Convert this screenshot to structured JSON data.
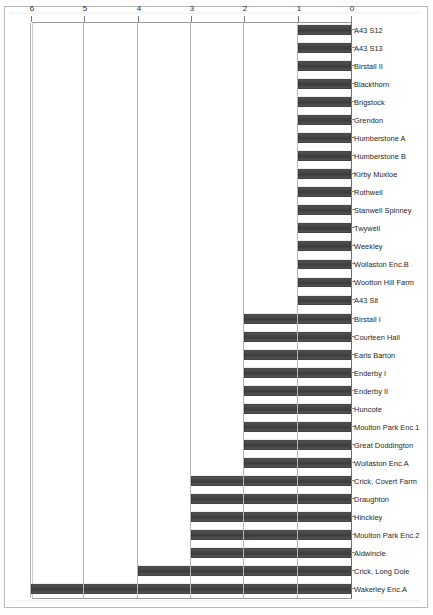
{
  "figure": {
    "title": "",
    "orientation": "rotated-180",
    "axis_tick_labels": [
      "0",
      "1",
      "2",
      "3",
      "4",
      "5",
      "6"
    ]
  },
  "chart_data": {
    "type": "bar",
    "title": "",
    "xlabel": "",
    "ylabel": "",
    "orientation": "horizontal",
    "xlim": [
      0,
      6
    ],
    "grid": true,
    "legend": false,
    "tick_labels": [
      "0",
      "1",
      "2",
      "3",
      "4",
      "5",
      "6"
    ],
    "categories": [
      "Wakerley Enc.A",
      "Crick, Long Dole",
      "Aldwincle",
      "Moulton Park Enc.2",
      "Hinckley",
      "Draughton",
      "Crick, Covert Farm",
      "Wollaston Enc.A",
      "Great Doddington",
      "Moulton Park Enc.1",
      "Huncote",
      "Enderby II",
      "Enderby I",
      "Earls Barton",
      "Courteen Hall",
      "Birstall I",
      "A43 Sit",
      "Wootton Hill Farm",
      "Wollaston Enc.B",
      "Weekley",
      "Twywell",
      "Stanwell Spinney",
      "Rothwell",
      "Kirby Muxloe",
      "Humberstone B",
      "Humberstone A",
      "Grendon",
      "Brigstock",
      "Blackthorn",
      "Birstall II",
      "A43 S13",
      "A43 S12"
    ],
    "values": [
      6,
      4,
      3,
      3,
      3,
      3,
      3,
      2,
      2,
      2,
      2,
      2,
      2,
      2,
      2,
      2,
      1,
      1,
      1,
      1,
      1,
      1,
      1,
      1,
      1,
      1,
      1,
      1,
      1,
      1,
      1,
      1
    ],
    "bar_color": "#474747"
  }
}
